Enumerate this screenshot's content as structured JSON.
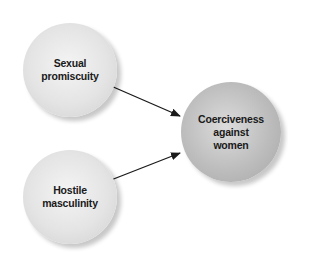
{
  "diagram": {
    "nodes": [
      {
        "id": "sexual-promiscuity",
        "lines": [
          "Sexual",
          "promiscuity"
        ]
      },
      {
        "id": "hostile-masculinity",
        "lines": [
          "Hostile",
          "masculinity"
        ]
      },
      {
        "id": "coerciveness-against-women",
        "lines": [
          "Coerciveness",
          "against",
          "women"
        ]
      }
    ],
    "edges": [
      {
        "from": "sexual-promiscuity",
        "to": "coerciveness-against-women"
      },
      {
        "from": "hostile-masculinity",
        "to": "coerciveness-against-women"
      }
    ],
    "colors": {
      "predictor_node": "#e4e4e4",
      "outcome_node": "#bdbdbd",
      "arrow": "#1a1a1a",
      "text": "#1a1a1a"
    }
  }
}
